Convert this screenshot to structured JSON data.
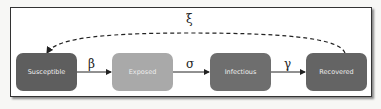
{
  "diagram": {
    "type": "compartmental-model",
    "nodes": [
      {
        "id": "S",
        "label": "Susceptible",
        "color": "#5e5e5e"
      },
      {
        "id": "E",
        "label": "Exposed",
        "color": "#a9a9a9"
      },
      {
        "id": "I",
        "label": "Infectious",
        "color": "#6e6e6e"
      },
      {
        "id": "R",
        "label": "Recovered",
        "color": "#646464"
      }
    ],
    "edges": [
      {
        "from": "S",
        "to": "E",
        "label": "β",
        "style": "solid"
      },
      {
        "from": "E",
        "to": "I",
        "label": "σ",
        "style": "solid"
      },
      {
        "from": "I",
        "to": "R",
        "label": "γ",
        "style": "solid"
      },
      {
        "from": "R",
        "to": "S",
        "label": "ξ",
        "style": "dashed"
      }
    ]
  }
}
